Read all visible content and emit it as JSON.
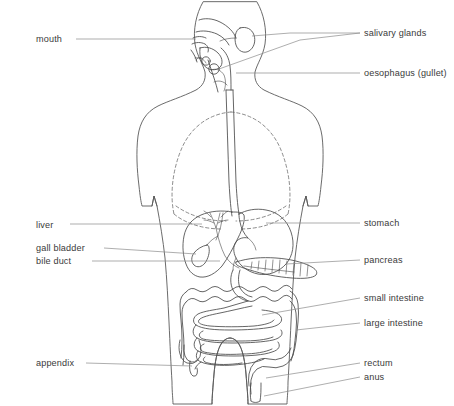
{
  "diagram": {
    "background_color": "#ffffff",
    "text_color": "#3a3a3a",
    "leader_color": "#8b8b8b",
    "outline_color": "#5a5a5a",
    "body_fill": "#f2f2f2",
    "liver_fill": "#e0e0e0",
    "organ_fill": "#ffffff"
  },
  "labels": {
    "left": [
      {
        "id": "mouth",
        "text": "mouth",
        "x": 36,
        "y": 42,
        "anchor": "start"
      },
      {
        "id": "liver",
        "text": "liver",
        "x": 36,
        "y": 228,
        "anchor": "start"
      },
      {
        "id": "gall-bladder",
        "text": "gall bladder",
        "x": 36,
        "y": 251,
        "anchor": "start"
      },
      {
        "id": "bile-duct",
        "text": "bile duct",
        "x": 36,
        "y": 264,
        "anchor": "start"
      },
      {
        "id": "appendix",
        "text": "appendix",
        "x": 36,
        "y": 366,
        "anchor": "start"
      }
    ],
    "right": [
      {
        "id": "salivary-glands",
        "text": "salivary glands",
        "x": 364,
        "y": 36,
        "anchor": "start"
      },
      {
        "id": "oesophagus",
        "text": "oesophagus (gullet)",
        "x": 364,
        "y": 76,
        "anchor": "start"
      },
      {
        "id": "stomach",
        "text": "stomach",
        "x": 364,
        "y": 226,
        "anchor": "start"
      },
      {
        "id": "pancreas",
        "text": "pancreas",
        "x": 364,
        "y": 263,
        "anchor": "start"
      },
      {
        "id": "small-intestine",
        "text": "small intestine",
        "x": 364,
        "y": 301,
        "anchor": "start"
      },
      {
        "id": "large-intestine",
        "text": "large intestine",
        "x": 364,
        "y": 326,
        "anchor": "start"
      },
      {
        "id": "rectum",
        "text": "rectum",
        "x": 364,
        "y": 366,
        "anchor": "start"
      },
      {
        "id": "anus",
        "text": "anus",
        "x": 364,
        "y": 380,
        "anchor": "start"
      }
    ]
  },
  "organs": [
    "mouth",
    "salivary glands",
    "oesophagus (gullet)",
    "stomach",
    "liver",
    "gall bladder",
    "bile duct",
    "pancreas",
    "small intestine",
    "large intestine",
    "appendix",
    "rectum",
    "anus"
  ]
}
